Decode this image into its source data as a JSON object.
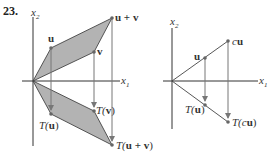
{
  "problem_number": "23.",
  "left_diagram": {
    "axis_labels": {
      "x1": "x",
      "x1_sub": "1",
      "x2": "x",
      "x2_sub": "2"
    },
    "points": {
      "u": {
        "label": "u"
      },
      "v": {
        "label": "v"
      },
      "u_plus_v": {
        "label": "u + v"
      },
      "T_u": {
        "prefix": "T(",
        "arg": "u",
        "suffix": ")"
      },
      "T_v": {
        "prefix": "T(",
        "arg": "v",
        "suffix": ")"
      },
      "T_u_plus_v": {
        "prefix": "T(",
        "arg": "u + v",
        "suffix": ")"
      }
    },
    "fill_color": "#b3b3b3"
  },
  "right_diagram": {
    "axis_labels": {
      "x1": "x",
      "x1_sub": "1",
      "x2": "x",
      "x2_sub": "2"
    },
    "points": {
      "u": {
        "label": "u"
      },
      "cu": {
        "c": "c",
        "u": "u"
      },
      "T_u": {
        "prefix": "T(",
        "arg": "u",
        "suffix": ")"
      },
      "T_cu": {
        "prefix": "T(",
        "c": "c",
        "u": "u",
        "suffix": ")"
      }
    }
  }
}
